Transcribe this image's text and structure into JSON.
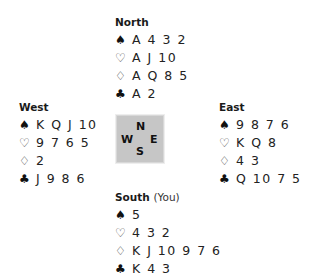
{
  "compass": {
    "n": "N",
    "w": "W",
    "e": "E",
    "s": "S"
  },
  "hands": {
    "north": {
      "name": "North",
      "spades": "A 4 3 2",
      "hearts": "A J 10",
      "diamonds": "A Q 8 5",
      "clubs": "A 2"
    },
    "west": {
      "name": "West",
      "spades": "K Q J 10",
      "hearts": "9 7 6 5",
      "diamonds": "2",
      "clubs": "J 9 8 6"
    },
    "east": {
      "name": "East",
      "spades": "9 8 7 6",
      "hearts": "K Q 8",
      "diamonds": "4 3",
      "clubs": "Q 10 7 5"
    },
    "south": {
      "name": "South",
      "tag": "(You)",
      "spades": "5",
      "hearts": "4 3 2",
      "diamonds": "K J 10 9 7 6",
      "clubs": "K 4 3"
    }
  },
  "suit_symbols": {
    "spade-icon": "♠",
    "heart-icon": "♡",
    "diamond-icon": "♢",
    "club-icon": "♣"
  }
}
